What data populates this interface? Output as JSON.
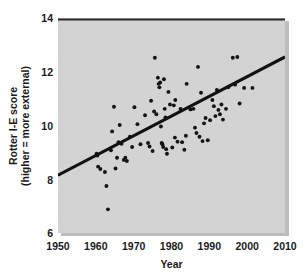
{
  "chart_data": {
    "type": "scatter",
    "title": "",
    "xlabel": "Year",
    "ylabel": "Rotter I-E score (higher = more external)",
    "ylabel_line1": "Rotter I-E score",
    "ylabel_line2": "(higher = more external)",
    "xlim": [
      1950,
      2010
    ],
    "ylim": [
      6,
      14
    ],
    "xticks": [
      1950,
      1960,
      1970,
      1980,
      1990,
      2000,
      2010
    ],
    "yticks": [
      6,
      8,
      10,
      12,
      14
    ],
    "grid": false,
    "legend": null,
    "plot_background_color": "#d3d3d3",
    "point_color": "#141414",
    "trendline_color": "#111111",
    "trendline": {
      "label": "linear fit",
      "x_start": 1950,
      "y_start": 8.15,
      "x_end": 2010,
      "y_end": 12.55
    },
    "points": [
      {
        "x": 1960.2,
        "y": 8.95
      },
      {
        "x": 1960.4,
        "y": 8.88
      },
      {
        "x": 1960.6,
        "y": 8.47
      },
      {
        "x": 1961.2,
        "y": 8.38
      },
      {
        "x": 1962.4,
        "y": 8.27
      },
      {
        "x": 1962.8,
        "y": 7.75
      },
      {
        "x": 1963.2,
        "y": 6.88
      },
      {
        "x": 1964.0,
        "y": 9.08
      },
      {
        "x": 1964.3,
        "y": 9.78
      },
      {
        "x": 1964.8,
        "y": 10.7
      },
      {
        "x": 1965.2,
        "y": 8.4
      },
      {
        "x": 1965.6,
        "y": 8.8
      },
      {
        "x": 1966.0,
        "y": 9.38
      },
      {
        "x": 1966.3,
        "y": 10.02
      },
      {
        "x": 1966.8,
        "y": 9.32
      },
      {
        "x": 1967.4,
        "y": 8.72
      },
      {
        "x": 1967.8,
        "y": 8.8
      },
      {
        "x": 1968.2,
        "y": 8.68
      },
      {
        "x": 1969.0,
        "y": 9.58
      },
      {
        "x": 1970.2,
        "y": 10.68
      },
      {
        "x": 1971.0,
        "y": 10.05
      },
      {
        "x": 1973.0,
        "y": 10.38
      },
      {
        "x": 1973.8,
        "y": 9.35
      },
      {
        "x": 1974.2,
        "y": 9.22
      },
      {
        "x": 1974.6,
        "y": 10.92
      },
      {
        "x": 1975.0,
        "y": 9.05
      },
      {
        "x": 1975.4,
        "y": 10.52
      },
      {
        "x": 1975.6,
        "y": 12.52
      },
      {
        "x": 1976.0,
        "y": 10.42
      },
      {
        "x": 1976.4,
        "y": 11.78
      },
      {
        "x": 1976.6,
        "y": 11.55
      },
      {
        "x": 1976.8,
        "y": 11.42
      },
      {
        "x": 1977.0,
        "y": 11.6
      },
      {
        "x": 1977.2,
        "y": 9.96
      },
      {
        "x": 1977.4,
        "y": 9.35
      },
      {
        "x": 1977.6,
        "y": 9.3
      },
      {
        "x": 1977.8,
        "y": 9.2
      },
      {
        "x": 1978.0,
        "y": 11.72
      },
      {
        "x": 1978.2,
        "y": 10.62
      },
      {
        "x": 1978.4,
        "y": 10.3
      },
      {
        "x": 1978.6,
        "y": 9.12
      },
      {
        "x": 1978.8,
        "y": 8.95
      },
      {
        "x": 1979.2,
        "y": 11.25
      },
      {
        "x": 1979.6,
        "y": 10.78
      },
      {
        "x": 1980.2,
        "y": 9.18
      },
      {
        "x": 1980.6,
        "y": 10.75
      },
      {
        "x": 1981.0,
        "y": 10.95
      },
      {
        "x": 1981.6,
        "y": 9.4
      },
      {
        "x": 1982.4,
        "y": 10.62
      },
      {
        "x": 1982.8,
        "y": 9.38
      },
      {
        "x": 1983.4,
        "y": 9.1
      },
      {
        "x": 1984.0,
        "y": 11.55
      },
      {
        "x": 1985.0,
        "y": 10.6
      },
      {
        "x": 1985.8,
        "y": 10.62
      },
      {
        "x": 1986.2,
        "y": 9.92
      },
      {
        "x": 1986.6,
        "y": 9.72
      },
      {
        "x": 1987.0,
        "y": 12.18
      },
      {
        "x": 1987.4,
        "y": 9.58
      },
      {
        "x": 1987.8,
        "y": 11.22
      },
      {
        "x": 1988.2,
        "y": 9.42
      },
      {
        "x": 1988.6,
        "y": 10.08
      },
      {
        "x": 1989.0,
        "y": 10.28
      },
      {
        "x": 1990.2,
        "y": 10.2
      },
      {
        "x": 1990.8,
        "y": 10.95
      },
      {
        "x": 1991.2,
        "y": 10.72
      },
      {
        "x": 1991.6,
        "y": 10.35
      },
      {
        "x": 1992.0,
        "y": 11.32
      },
      {
        "x": 1992.4,
        "y": 10.58
      },
      {
        "x": 1992.8,
        "y": 10.42
      },
      {
        "x": 1993.2,
        "y": 10.78
      },
      {
        "x": 1993.6,
        "y": 10.22
      },
      {
        "x": 1994.4,
        "y": 10.62
      },
      {
        "x": 1995.0,
        "y": 11.42
      },
      {
        "x": 1996.2,
        "y": 12.52
      },
      {
        "x": 1996.8,
        "y": 11.52
      },
      {
        "x": 1997.4,
        "y": 12.55
      },
      {
        "x": 1998.0,
        "y": 10.82
      },
      {
        "x": 1999.2,
        "y": 11.4
      },
      {
        "x": 2001.4,
        "y": 11.4
      },
      {
        "x": 1971.8,
        "y": 9.3
      },
      {
        "x": 1969.6,
        "y": 9.2
      },
      {
        "x": 1983.8,
        "y": 9.62
      },
      {
        "x": 1989.6,
        "y": 9.45
      },
      {
        "x": 1980.9,
        "y": 9.55
      }
    ]
  },
  "axes": {
    "x_tick_labels": [
      "1950",
      "1960",
      "1970",
      "1980",
      "1990",
      "2000",
      "2010"
    ],
    "y_tick_labels": [
      "6",
      "8",
      "10",
      "12",
      "14"
    ],
    "x_axis_title": "Year",
    "y_axis_title_line1": "Rotter I-E score",
    "y_axis_title_line2": "(higher = more external)"
  }
}
